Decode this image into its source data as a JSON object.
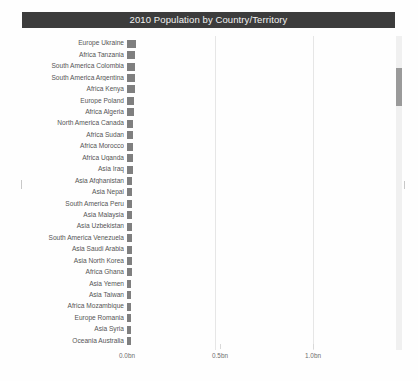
{
  "title": {
    "text": "2010 Population by Country/Territory",
    "bar_color": "#3c3c3c",
    "text_color": "#f2f2f2"
  },
  "chart_data": {
    "type": "bar",
    "orientation": "horizontal",
    "title": "2010 Population by Country/Territory",
    "xlabel": "",
    "ylabel": "",
    "unit": "bn",
    "bar_color": "#7f7f7f",
    "grid": true,
    "legend": null,
    "xlim": [
      0,
      1.25
    ],
    "xticks": [
      0.0,
      0.5,
      1.0
    ],
    "xticklabels": [
      "0.0bn",
      "0.5bn",
      "1.0bn"
    ],
    "categories": [
      "Europe Ukraine",
      "Africa Tanzania",
      "South America Colombia",
      "South America Argentina",
      "Africa Kenya",
      "Europe Poland",
      "Africa Algeria",
      "North America Canada",
      "Africa Sudan",
      "Africa Morocco",
      "Africa Uganda",
      "Asia Iraq",
      "Asia Afghanistan",
      "Asia Nepal",
      "South America Peru",
      "Asia Malaysia",
      "Asia Uzbekistan",
      "South America Venezuela",
      "Asia Saudi Arabia",
      "Asia North Korea",
      "Africa Ghana",
      "Asia Yemen",
      "Asia Taiwan",
      "Africa Mozambique",
      "Europe Romania",
      "Asia Syria",
      "Oceania Australia"
    ],
    "values": [
      0.0459,
      0.045,
      0.0446,
      0.0409,
      0.0407,
      0.0381,
      0.036,
      0.0342,
      0.0341,
      0.0318,
      0.0317,
      0.0305,
      0.029,
      0.0268,
      0.0295,
      0.0283,
      0.0279,
      0.0289,
      0.0274,
      0.0246,
      0.0244,
      0.0232,
      0.0232,
      0.0234,
      0.0203,
      0.0206,
      0.0222
    ]
  },
  "scrollbar": {
    "orientation": "vertical",
    "thumb_position_pct": 10
  }
}
